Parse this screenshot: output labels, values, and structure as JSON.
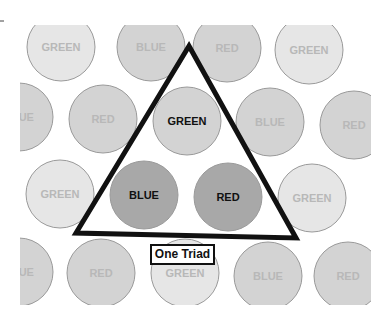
{
  "diagram": {
    "clip": {
      "x": 20,
      "y": 25,
      "width": 351,
      "height": 280
    },
    "radius": 34,
    "colors": {
      "light": "#e6e6e6",
      "medium": "#d3d3d3",
      "dark": "#a8a8a8",
      "stroke": "#9a9a9a",
      "faint_text": "#b8b8b8",
      "bold_text": "#111111",
      "triangle": "#111111"
    },
    "circles": [
      {
        "cx": 61,
        "cy": 47,
        "label": "GREEN",
        "shade": "light",
        "emph": false
      },
      {
        "cx": 151,
        "cy": 47,
        "label": "BLUE",
        "shade": "medium",
        "emph": false
      },
      {
        "cx": 227,
        "cy": 48,
        "label": "RED",
        "shade": "medium",
        "emph": false
      },
      {
        "cx": 309,
        "cy": 50,
        "label": "GREEN",
        "shade": "light",
        "emph": false
      },
      {
        "cx": 19,
        "cy": 117,
        "label": "BLUE",
        "shade": "medium",
        "emph": false
      },
      {
        "cx": 103,
        "cy": 119,
        "label": "RED",
        "shade": "medium",
        "emph": false
      },
      {
        "cx": 187,
        "cy": 121,
        "label": "GREEN",
        "shade": "medium",
        "emph": true
      },
      {
        "cx": 270,
        "cy": 122,
        "label": "BLUE",
        "shade": "medium",
        "emph": false
      },
      {
        "cx": 354,
        "cy": 125,
        "label": "RED",
        "shade": "medium",
        "emph": false
      },
      {
        "cx": 60,
        "cy": 194,
        "label": "GREEN",
        "shade": "light",
        "emph": false
      },
      {
        "cx": 144,
        "cy": 195,
        "label": "BLUE",
        "shade": "dark",
        "emph": true
      },
      {
        "cx": 228,
        "cy": 197,
        "label": "RED",
        "shade": "dark",
        "emph": true
      },
      {
        "cx": 312,
        "cy": 198,
        "label": "GREEN",
        "shade": "light",
        "emph": false
      },
      {
        "cx": 19,
        "cy": 272,
        "label": "BLUE",
        "shade": "medium",
        "emph": false
      },
      {
        "cx": 101,
        "cy": 273,
        "label": "RED",
        "shade": "medium",
        "emph": false
      },
      {
        "cx": 185,
        "cy": 273,
        "label": "GREEN",
        "shade": "light",
        "emph": false
      },
      {
        "cx": 268,
        "cy": 276,
        "label": "BLUE",
        "shade": "medium",
        "emph": false
      },
      {
        "cx": 348,
        "cy": 276,
        "label": "RED",
        "shade": "medium",
        "emph": false
      }
    ],
    "triangle": {
      "points": [
        [
          189,
          46
        ],
        [
          76,
          233
        ],
        [
          296,
          238
        ]
      ],
      "stroke_width": 5
    },
    "triad_label": "One Triad"
  }
}
